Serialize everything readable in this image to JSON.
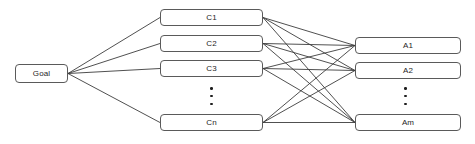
{
  "diagram": {
    "type": "hierarchy-graph",
    "colors": {
      "node_border": "#5a5a5a",
      "node_fill": "#ffffff",
      "edge": "#3c3c3c",
      "text": "#1e1e1e",
      "background": "#ffffff"
    },
    "levels": [
      {
        "id": "goal",
        "name": "goal-level",
        "nodes": [
          {
            "id": "goal",
            "label": "Goal",
            "x": 15,
            "y": 64,
            "w": 53,
            "h": 19
          }
        ]
      },
      {
        "id": "criteria",
        "name": "criteria-level",
        "ellipsis": {
          "x": 211,
          "y": 87
        },
        "nodes": [
          {
            "id": "c1",
            "label": "C1",
            "x": 160,
            "y": 9,
            "w": 103,
            "h": 17
          },
          {
            "id": "c2",
            "label": "C2",
            "x": 160,
            "y": 35,
            "w": 103,
            "h": 17
          },
          {
            "id": "c3",
            "label": "C3",
            "x": 160,
            "y": 60,
            "w": 103,
            "h": 17
          },
          {
            "id": "cn",
            "label": "Cn",
            "x": 160,
            "y": 114,
            "w": 103,
            "h": 17
          }
        ]
      },
      {
        "id": "alternatives",
        "name": "alternatives-level",
        "ellipsis": {
          "x": 405,
          "y": 87
        },
        "nodes": [
          {
            "id": "a1",
            "label": "A1",
            "x": 355,
            "y": 37,
            "w": 106,
            "h": 17
          },
          {
            "id": "a2",
            "label": "A2",
            "x": 355,
            "y": 62,
            "w": 106,
            "h": 17
          },
          {
            "id": "am",
            "label": "Am",
            "x": 355,
            "y": 114,
            "w": 106,
            "h": 17
          }
        ]
      }
    ],
    "edges": [
      {
        "from": "goal",
        "to": "c1"
      },
      {
        "from": "goal",
        "to": "c2"
      },
      {
        "from": "goal",
        "to": "c3"
      },
      {
        "from": "goal",
        "to": "cn"
      },
      {
        "from": "c1",
        "to": "a1"
      },
      {
        "from": "c1",
        "to": "a2"
      },
      {
        "from": "c1",
        "to": "am"
      },
      {
        "from": "c2",
        "to": "a1"
      },
      {
        "from": "c2",
        "to": "a2"
      },
      {
        "from": "c2",
        "to": "am"
      },
      {
        "from": "c3",
        "to": "a1"
      },
      {
        "from": "c3",
        "to": "a2"
      },
      {
        "from": "c3",
        "to": "am"
      },
      {
        "from": "cn",
        "to": "a1"
      },
      {
        "from": "cn",
        "to": "a2"
      },
      {
        "from": "cn",
        "to": "am"
      }
    ]
  }
}
